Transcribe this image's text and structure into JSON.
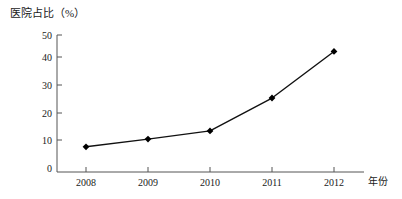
{
  "chart_data": {
    "type": "line",
    "title": "",
    "ylabel": "医院占比（%）",
    "xlabel": "年份",
    "categories": [
      "2008",
      "2009",
      "2010",
      "2011",
      "2012"
    ],
    "values": [
      9.2,
      12,
      15,
      27,
      44
    ],
    "series": [
      {
        "name": "医院占比",
        "values": [
          9.2,
          12,
          15,
          27,
          44
        ]
      }
    ],
    "ylim": [
      0,
      50
    ],
    "yticks": [
      "0",
      "10",
      "20",
      "30",
      "40",
      "50"
    ],
    "ytick_values": [
      0,
      10,
      20,
      30,
      40,
      50
    ],
    "grid": false,
    "legend": "none",
    "marker": "diamond",
    "line_color": "#111111",
    "marker_color": "#000000",
    "axis_color": "#555555",
    "background": "#ffffff"
  }
}
